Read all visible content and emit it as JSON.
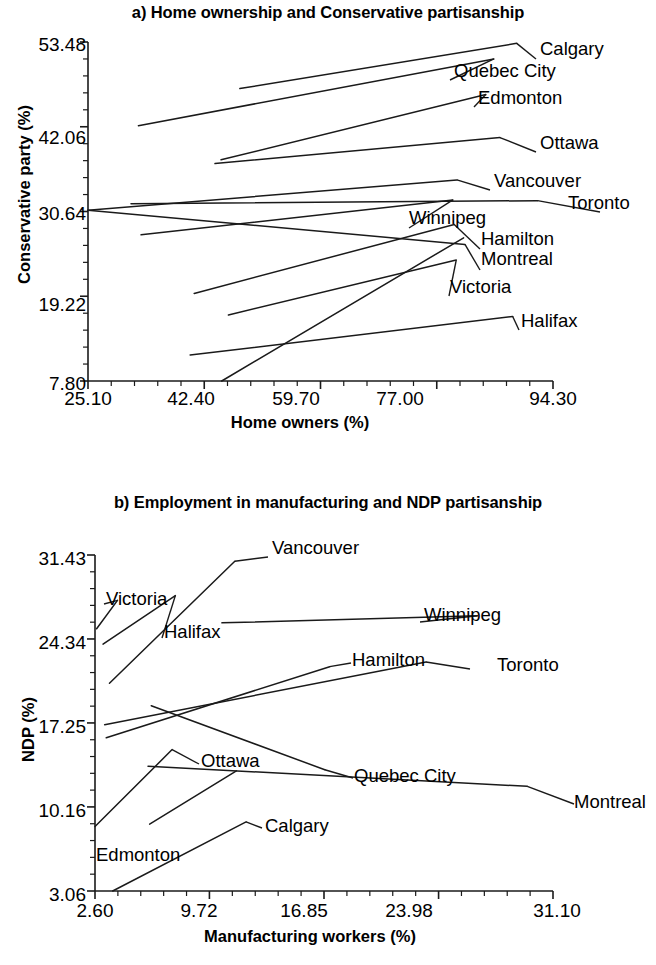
{
  "figure": {
    "background_color": "#ffffff",
    "line_color": "#1a1a1a",
    "text_color": "#000000"
  },
  "panels": [
    {
      "id": "a",
      "title": "a) Home ownership and Conservative partisanship"
    },
    {
      "id": "b",
      "title": "b) Employment in manufacturing and NDP partisanship"
    }
  ],
  "chart_data": [
    {
      "type": "line",
      "title": "a) Home ownership and Conservative partisanship",
      "xlabel": "Home owners (%)",
      "ylabel": "Conservative party (%)",
      "xlim": [
        25.1,
        94.3
      ],
      "ylim": [
        7.8,
        53.48
      ],
      "xticks": [
        25.1,
        42.4,
        59.7,
        77.0,
        94.3
      ],
      "xtick_labels": [
        "25.10",
        "42.40",
        "59.70",
        "77.00",
        "94.30"
      ],
      "yticks": [
        7.8,
        19.22,
        30.64,
        42.06,
        53.48
      ],
      "ytick_labels": [
        "7.80",
        "19.22",
        "30.64",
        "42.06",
        "53.48"
      ],
      "minor_ticks_per_interval": 4,
      "grid": false,
      "legend": "inline-endpoint-labels",
      "series": [
        {
          "name": "Calgary",
          "x": [
            47.7,
            88.9
          ],
          "y": [
            47.2,
            53.3
          ],
          "label_pos": [
            540,
            50
          ]
        },
        {
          "name": "Quebec City",
          "x": [
            32.6,
            85.5
          ],
          "y": [
            42.2,
            51.2
          ],
          "label_pos": [
            454,
            71
          ]
        },
        {
          "name": "Edmonton",
          "x": [
            44.9,
            84.3
          ],
          "y": [
            37.6,
            46.4
          ],
          "label_pos": [
            478,
            98
          ]
        },
        {
          "name": "Ottawa",
          "x": [
            44.0,
            86.4
          ],
          "y": [
            37.1,
            40.6
          ],
          "label_pos": [
            540,
            143
          ]
        },
        {
          "name": "Vancouver",
          "x": [
            25.1,
            80.0
          ],
          "y": [
            30.8,
            34.9
          ],
          "label_pos": [
            494,
            181
          ]
        },
        {
          "name": "Toronto",
          "x": [
            31.5,
            92.0
          ],
          "y": [
            31.7,
            32.1
          ],
          "label_pos": [
            604,
            203
          ]
        },
        {
          "name": "Winnipeg",
          "x": [
            33.0,
            79.4
          ],
          "y": [
            27.5,
            32.2
          ],
          "label_pos": [
            413,
            219
          ]
        },
        {
          "name": "Hamilton",
          "x": [
            40.9,
            79.6
          ],
          "y": [
            19.6,
            28.9
          ],
          "label_pos": [
            484,
            240
          ]
        },
        {
          "name": "Montreal",
          "x": [
            25.1,
            81.2
          ],
          "y": [
            30.8,
            26.2
          ],
          "label_pos": [
            484,
            261
          ]
        },
        {
          "name": "Victoria",
          "x": [
            46.0,
            79.9
          ],
          "y": [
            16.7,
            24.1
          ],
          "label_pos": [
            453,
            287
          ]
        },
        {
          "name": "Halifax",
          "x": [
            40.3,
            88.3
          ],
          "y": [
            11.3,
            16.5
          ],
          "label_pos": [
            523,
            321
          ]
        }
      ],
      "diagonal_extra_series": {
        "name": "Victoria-steep",
        "x": [
          45.0,
          81.0
        ],
        "y": [
          7.8,
          27.1
        ]
      }
    },
    {
      "type": "line",
      "title": "b) Employment in manufacturing and NDP partisanship",
      "xlabel": "Manufacturing workers (%)",
      "ylabel": "NDP (%)",
      "xlim": [
        2.6,
        31.1
      ],
      "ylim": [
        3.06,
        31.43
      ],
      "xticks": [
        2.6,
        9.72,
        16.85,
        23.98,
        31.1
      ],
      "xtick_labels": [
        "2.60",
        "9.72",
        "16.85",
        "23.98",
        "31.10"
      ],
      "yticks": [
        3.06,
        10.16,
        17.25,
        24.34,
        31.43
      ],
      "ytick_labels": [
        "3.06",
        "10.16",
        "17.25",
        "24.34",
        "31.43"
      ],
      "minor_ticks_per_interval": 4,
      "grid": false,
      "legend": "inline-endpoint-labels",
      "series": [
        {
          "name": "Vancouver",
          "x": [
            3.5,
            11.3
          ],
          "y": [
            20.6,
            30.9
          ],
          "label_pos": [
            272,
            548
          ]
        },
        {
          "name": "Victoria",
          "x": [
            2.7,
            4.0
          ],
          "y": [
            25.2,
            27.6
          ],
          "label_pos": [
            108,
            595
          ]
        },
        {
          "name": "Halifax",
          "x": [
            3.1,
            7.6
          ],
          "y": [
            23.9,
            28.0
          ],
          "label_pos": [
            166,
            629
          ]
        },
        {
          "name": "Winnipeg",
          "x": [
            10.5,
            26.4
          ],
          "y": [
            25.7,
            26.3
          ],
          "label_pos": [
            424,
            613
          ]
        },
        {
          "name": "Hamilton",
          "x": [
            3.3,
            17.2
          ],
          "y": [
            16.0,
            22.0
          ],
          "label_pos": [
            355,
            654
          ]
        },
        {
          "name": "Toronto",
          "x": [
            3.2,
            23.2
          ],
          "y": [
            17.1,
            22.4
          ],
          "label_pos": [
            474,
            660
          ]
        },
        {
          "name": "Ottawa",
          "x": [
            2.6,
            7.4
          ],
          "y": [
            8.5,
            15.0
          ],
          "label_pos": [
            203,
            755
          ]
        },
        {
          "name": "Quebec City",
          "x": [
            6.1,
            16.9
          ],
          "y": [
            18.7,
            13.3
          ],
          "label_pos": [
            357,
            769
          ]
        },
        {
          "name": "Montreal",
          "x": [
            5.9,
            29.5
          ],
          "y": [
            13.6,
            11.9
          ],
          "label_pos": [
            578,
            795
          ]
        },
        {
          "name": "Edmonton",
          "x": [
            6.0,
            11.4
          ],
          "y": [
            8.7,
            13.2
          ],
          "label_pos": [
            96,
            851
          ]
        },
        {
          "name": "Calgary",
          "x": [
            3.7,
            12.0
          ],
          "y": [
            3.06,
            8.9
          ],
          "label_pos": [
            266,
            819
          ]
        }
      ]
    }
  ],
  "panel_a": {
    "title": "a) Home ownership and Conservative partisanship",
    "x_axis_title": "Home owners (%)",
    "y_axis_title": "Conservative party (%)",
    "x_tick_labels": [
      "25.10",
      "42.40",
      "59.70",
      "77.00",
      "94.30"
    ],
    "y_tick_labels": [
      "53.48",
      "42.06",
      "30.64",
      "19.22",
      "7.80"
    ],
    "series_labels": [
      "Calgary",
      "Quebec City",
      "Edmonton",
      "Ottawa",
      "Vancouver",
      "Toronto",
      "Winnipeg",
      "Hamilton",
      "Montreal",
      "Victoria",
      "Halifax"
    ]
  },
  "panel_b": {
    "title": "b) Employment in manufacturing and NDP partisanship",
    "x_axis_title": "Manufacturing workers (%)",
    "y_axis_title": "NDP (%)",
    "x_tick_labels": [
      "2.60",
      "9.72",
      "16.85",
      "23.98",
      "31.10"
    ],
    "y_tick_labels": [
      "31.43",
      "24.34",
      "17.25",
      "10.16",
      "3.06"
    ],
    "series_labels": [
      "Vancouver",
      "Victoria",
      "Halifax",
      "Winnipeg",
      "Hamilton",
      "Toronto",
      "Ottawa",
      "Quebec City",
      "Montreal",
      "Edmonton",
      "Calgary"
    ]
  }
}
